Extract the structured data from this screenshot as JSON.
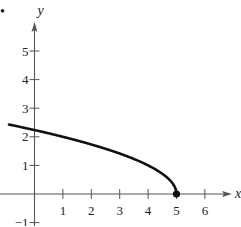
{
  "chart_data": {
    "type": "line",
    "title": "",
    "xlabel": "x",
    "ylabel": "y",
    "xlim": [
      -1.2,
      6.9
    ],
    "ylim": [
      -1.1,
      6.0
    ],
    "x_ticks": [
      1,
      2,
      3,
      4,
      5,
      6
    ],
    "y_ticks": [
      -1,
      1,
      2,
      3,
      4,
      5
    ],
    "x_tick_labels": [
      "1",
      "2",
      "3",
      "4",
      "5",
      "6"
    ],
    "y_tick_labels": [
      "−1",
      "1",
      "2",
      "3",
      "4",
      "5"
    ],
    "grid": false,
    "legend": null,
    "series": [
      {
        "name": "y = sqrt(5 - x)",
        "x": [
          -0.9,
          0,
          1,
          2,
          3,
          4,
          4.5,
          4.9,
          5
        ],
        "y": [
          2.43,
          2.24,
          2.0,
          1.73,
          1.41,
          1.0,
          0.71,
          0.32,
          0.0
        ]
      }
    ],
    "annotations": [
      {
        "type": "closed-point",
        "x": 5,
        "y": 0
      }
    ]
  },
  "bullet": "•"
}
